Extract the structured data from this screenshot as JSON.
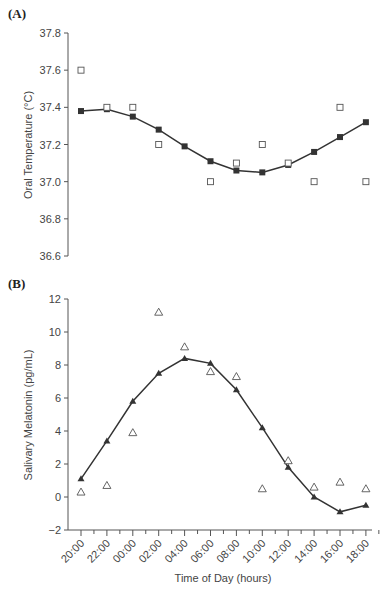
{
  "chart_data": [
    {
      "type": "line",
      "panel": "(A)",
      "title": "",
      "xlabel": "",
      "ylabel": "Oral Temperature (°C)",
      "ylim": [
        36.6,
        37.8
      ],
      "yticks": [
        "37.8",
        "37.6",
        "37.4",
        "37.2",
        "37.0",
        "36.8",
        "36.6"
      ],
      "grid": false,
      "categories": [
        "20:00",
        "22:00",
        "00:00",
        "02:00",
        "04:00",
        "06:00",
        "08:00",
        "10:00",
        "12:00",
        "14:00",
        "16:00",
        "18:00"
      ],
      "series": [
        {
          "name": "Fitted (filled squares)",
          "marker": "filled-square",
          "line": true,
          "values": [
            37.38,
            37.39,
            37.35,
            37.28,
            37.19,
            37.11,
            37.06,
            37.05,
            37.09,
            37.16,
            37.24,
            37.32
          ]
        },
        {
          "name": "Observed (open squares)",
          "marker": "open-square",
          "line": false,
          "values": [
            37.6,
            37.4,
            37.4,
            37.2,
            null,
            37.0,
            37.1,
            37.2,
            37.1,
            37.0,
            37.4,
            37.0
          ]
        }
      ]
    },
    {
      "type": "line",
      "panel": "(B)",
      "title": "",
      "xlabel": "Time of Day (hours)",
      "ylabel": "Salivary Melatonin (pg/mL)",
      "ylim": [
        -2,
        12
      ],
      "yticks": [
        "12",
        "10",
        "8",
        "6",
        "4",
        "2",
        "0",
        "−2"
      ],
      "grid": false,
      "categories": [
        "20:00",
        "22:00",
        "00:00",
        "02:00",
        "04:00",
        "06:00",
        "08:00",
        "10:00",
        "12:00",
        "14:00",
        "16:00",
        "18:00"
      ],
      "series": [
        {
          "name": "Fitted (filled triangles)",
          "marker": "filled-triangle",
          "line": true,
          "values": [
            1.1,
            3.4,
            5.8,
            7.5,
            8.4,
            8.1,
            6.5,
            4.2,
            1.8,
            0.0,
            -0.9,
            -0.5
          ]
        },
        {
          "name": "Observed (open triangles)",
          "marker": "open-triangle",
          "line": false,
          "values": [
            0.3,
            0.7,
            3.9,
            11.2,
            9.1,
            7.6,
            7.3,
            0.5,
            2.2,
            0.6,
            0.9,
            0.5
          ]
        }
      ]
    }
  ],
  "labels": {
    "panel_a": "(A)",
    "panel_b": "(B)",
    "a_ylabel": "Oral Temperature (°C)",
    "b_ylabel": "Salivary Melatonin (pg/mL)",
    "b_xlabel": "Time of Day (hours)"
  }
}
